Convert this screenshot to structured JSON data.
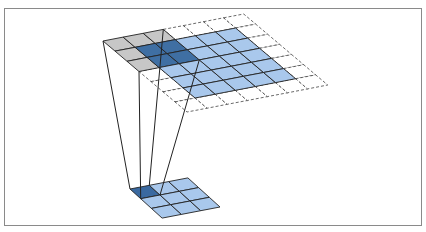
{
  "diagram": {
    "title": "",
    "colors": {
      "frame_border": "#8a8a8a",
      "input_cell": "#a9c8ec",
      "padding_cell": "#ffffff",
      "kernel_cell": "#c4c4c4",
      "kernel_overlap_cell": "#3f6fa3",
      "output_cell": "#a9c8ec",
      "output_active_cell": "#3a69a0",
      "grid_line": "#222222",
      "padding_line": "#444444"
    },
    "input_grid": {
      "label": "input",
      "rows": 7,
      "cols": 7,
      "padding": 1,
      "origin": [
        103,
        41
      ],
      "u": [
        20.1,
        -3.86
      ],
      "v": [
        12.0,
        10.15
      ],
      "kernel": {
        "row": 0,
        "col": 0,
        "size": 3
      }
    },
    "output_grid": {
      "label": "output",
      "rows": 3,
      "cols": 3,
      "origin": [
        130,
        189
      ],
      "u": [
        19.3,
        -3.7
      ],
      "v": [
        10.7,
        9.7
      ],
      "active": {
        "row": 0,
        "col": 0
      }
    }
  }
}
